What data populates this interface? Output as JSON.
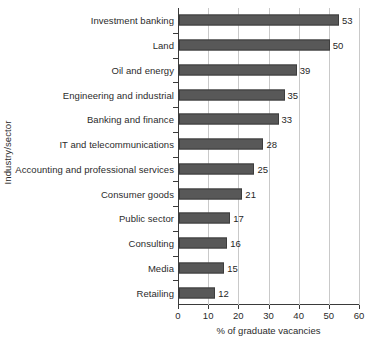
{
  "chart_data": {
    "type": "bar",
    "orientation": "horizontal",
    "title": "",
    "xlabel": "% of graduate vacancies",
    "ylabel": "Industry/sector",
    "xlim": [
      0,
      60
    ],
    "xticks": [
      0,
      10,
      20,
      30,
      40,
      50,
      60
    ],
    "grid": "vertical",
    "legend": "none",
    "bar_color": "#585858",
    "categories": [
      "Investment banking",
      "Land",
      "Oil and energy",
      "Engineering and industrial",
      "Banking and finance",
      "IT and telecommunications",
      "Accounting and professional services",
      "Consumer goods",
      "Public sector",
      "Consulting",
      "Media",
      "Retailing"
    ],
    "values": [
      53,
      50,
      39,
      35,
      33,
      28,
      25,
      21,
      17,
      16,
      15,
      12
    ],
    "data_labels": [
      "53",
      "50",
      "39",
      "35",
      "33",
      "28",
      "25",
      "21",
      "17",
      "16",
      "15",
      "12"
    ]
  }
}
